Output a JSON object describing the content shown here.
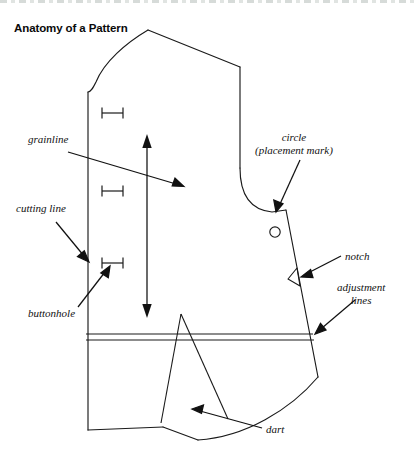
{
  "figure": {
    "title": "Anatomy of a Pattern",
    "line_color": "#1a1a1a",
    "text_color": "#111111",
    "background": "#ffffff"
  },
  "labels": {
    "grainline": "grainline",
    "cutting_line": "cutting line",
    "buttonhole": "buttonhole",
    "circle_line1": "circle",
    "circle_line2": "(placement mark)",
    "notch": "notch",
    "adjustment_line1": "adjustment",
    "adjustment_line2": "lines",
    "dart": "dart"
  },
  "diagram_parts": [
    {
      "name": "pattern-outline",
      "description": "garment pattern piece outline"
    },
    {
      "name": "grainline-arrow",
      "description": "vertical double-headed arrow"
    },
    {
      "name": "buttonhole-mark",
      "count": 3,
      "description": "I-beam buttonhole marks"
    },
    {
      "name": "placement-circle",
      "description": "small open circle"
    },
    {
      "name": "notch-triangle",
      "description": "triangular notch on seam edge"
    },
    {
      "name": "adjustment-lines",
      "count": 2,
      "description": "pair of horizontal parallel lines"
    },
    {
      "name": "dart-triangle",
      "description": "narrow triangular dart"
    }
  ]
}
